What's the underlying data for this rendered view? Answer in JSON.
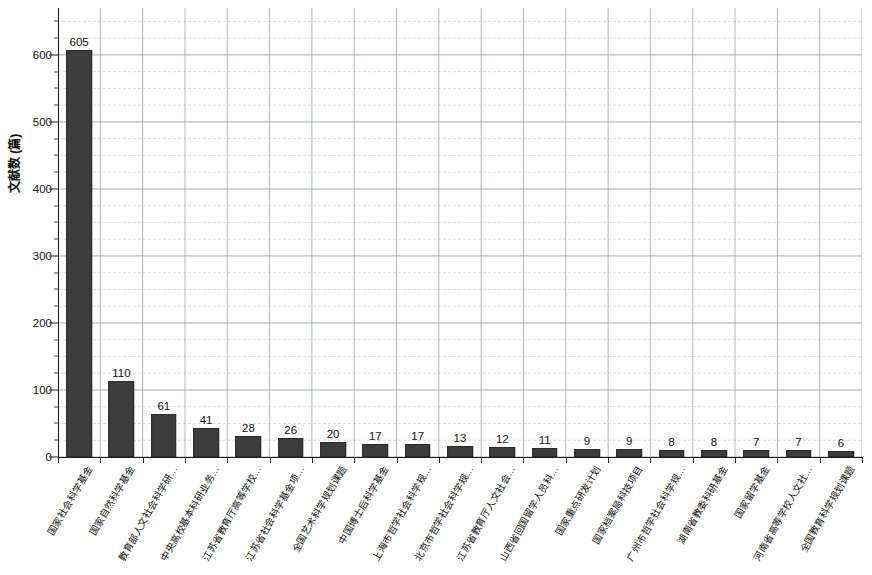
{
  "chart_data": {
    "type": "bar",
    "title": "",
    "xlabel": "",
    "ylabel": "文献数 (篇)",
    "ylim": [
      0,
      670
    ],
    "y_major_ticks": [
      0,
      100,
      200,
      300,
      400,
      500,
      600
    ],
    "y_tick_labels": [
      "0",
      "100",
      "200",
      "300",
      "400",
      "500",
      "600"
    ],
    "y_minor_step": 25,
    "grid": true,
    "legend": "none",
    "bar_color": "#3c3c3c",
    "categories": [
      "国家社会科学基金",
      "国家自然科学基金",
      "教育部人文社会科学研…",
      "中央高校基本科研业务…",
      "江苏省教育厅高等学校…",
      "江苏省社会科学基金项…",
      "全国艺术科学规划课题",
      "中国博士后科学基金",
      "上海市哲学社会科学规…",
      "北京市哲学社会科学规…",
      "江苏省教育厅人文社会…",
      "山西省回国留学人员科…",
      "国家重点研发计划",
      "国家档案局科技项目",
      "广州市哲学社会科学规…",
      "湖南省教委科研基金",
      "国家留学基金",
      "河南省高等学校人文社…",
      "全国教育科学规划课题"
    ],
    "values": [
      605,
      110,
      61,
      41,
      28,
      26,
      20,
      17,
      17,
      13,
      12,
      11,
      9,
      9,
      8,
      8,
      7,
      7,
      6
    ],
    "value_labels": [
      "605",
      "110",
      "61",
      "41",
      "28",
      "26",
      "20",
      "17",
      "17",
      "13",
      "12",
      "11",
      "9",
      "9",
      "8",
      "8",
      "7",
      "7",
      "6"
    ]
  }
}
